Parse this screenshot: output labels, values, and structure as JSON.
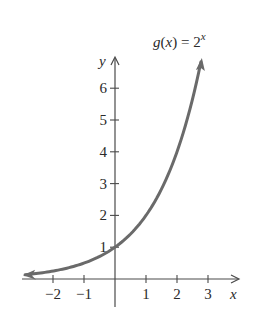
{
  "chart_data": {
    "type": "line",
    "function_label": {
      "prefix": "g(x) = 2",
      "exponent": "x"
    },
    "xlabel": "x",
    "ylabel": "y",
    "xlim": [
      -2.9,
      3.9
    ],
    "ylim": [
      -0.9,
      7.0
    ],
    "x_ticks": [
      -2,
      -1,
      1,
      2,
      3
    ],
    "x_tick_labels": [
      "−2",
      "−1",
      "1",
      "2",
      "3"
    ],
    "y_ticks": [
      1,
      2,
      3,
      4,
      5,
      6
    ],
    "y_tick_labels": [
      "1",
      "2",
      "3",
      "4",
      "5",
      "6"
    ],
    "grid": false,
    "legend": null,
    "series": [
      {
        "name": "g(x) = 2^x",
        "color": "#6a6a6a",
        "x": [
          -2.9,
          -2.5,
          -2,
          -1.5,
          -1,
          -0.5,
          0,
          0.5,
          1,
          1.5,
          2,
          2.5,
          2.77
        ],
        "y": [
          0.13,
          0.18,
          0.25,
          0.35,
          0.5,
          0.71,
          1,
          1.41,
          2,
          2.83,
          4,
          5.66,
          6.82
        ],
        "arrows": "both"
      }
    ],
    "axis_color": "#4a4a4a"
  }
}
